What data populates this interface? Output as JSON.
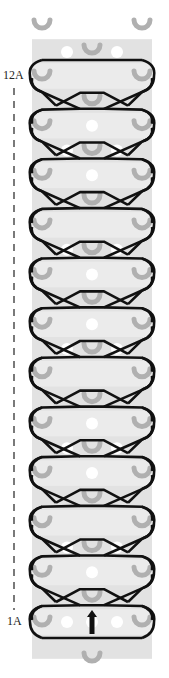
{
  "diagram": {
    "type": "rainbow-loom-pattern",
    "labels": {
      "top": "12A",
      "bottom": "1A"
    },
    "rows": 12,
    "columns": 3,
    "direction_arrow": "up-arrow",
    "colors": {
      "background": "#ffffff",
      "board": "#ebebeb",
      "board_dark": "#e2e2e2",
      "peg": "#b0b0b0",
      "hole": "#ffffff",
      "band": "#111111",
      "label": "#222222"
    },
    "geometry": {
      "left_x": 42,
      "center_x": 92,
      "right_x": 142,
      "top_row_y": 76,
      "bottom_row_y": 622,
      "board_left": 32,
      "board_right": 152,
      "board_top": 40,
      "board_bottom": 645
    }
  }
}
